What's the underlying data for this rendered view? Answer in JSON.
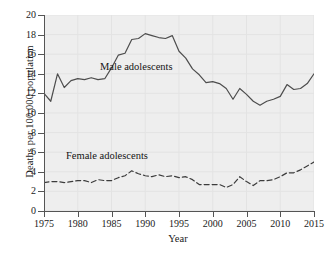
{
  "chart_data": {
    "type": "line",
    "title": "",
    "xlabel": "Year",
    "ylabel": "Deaths per 100,000 population",
    "xlim": [
      1975,
      2015
    ],
    "ylim": [
      0,
      20
    ],
    "xticks": [
      1975,
      1980,
      1985,
      1990,
      1995,
      2000,
      2005,
      2010,
      2015
    ],
    "yticks": [
      0,
      2,
      4,
      6,
      8,
      10,
      12,
      14,
      16,
      18,
      20
    ],
    "grid": true,
    "legend_position": "inline-annotations",
    "x": [
      1975,
      1976,
      1977,
      1978,
      1979,
      1980,
      1981,
      1982,
      1983,
      1984,
      1985,
      1986,
      1987,
      1988,
      1989,
      1990,
      1991,
      1992,
      1993,
      1994,
      1995,
      1996,
      1997,
      1998,
      1999,
      2000,
      2001,
      2002,
      2003,
      2004,
      2005,
      2006,
      2007,
      2008,
      2009,
      2010,
      2011,
      2012,
      2013,
      2014,
      2015
    ],
    "series": [
      {
        "name": "Male adolescents",
        "style": "solid",
        "color": "#4d4d4d",
        "annotation": "Male adolescents",
        "values": [
          12.0,
          11.2,
          14.0,
          12.6,
          13.3,
          13.5,
          13.4,
          13.6,
          13.4,
          13.5,
          14.6,
          15.9,
          16.1,
          17.5,
          17.6,
          18.1,
          17.9,
          17.7,
          17.6,
          17.9,
          16.3,
          15.6,
          14.5,
          13.9,
          13.1,
          13.2,
          13.0,
          12.5,
          11.4,
          12.5,
          11.9,
          11.2,
          10.8,
          11.2,
          11.4,
          11.7,
          12.9,
          12.4,
          12.5,
          13.0,
          14.0
        ]
      },
      {
        "name": "Female adolescents",
        "style": "dashed",
        "color": "#3c3c3c",
        "annotation": "Female adolescents",
        "values": [
          2.9,
          3.0,
          3.0,
          2.9,
          3.0,
          3.1,
          3.1,
          2.9,
          3.2,
          3.1,
          3.1,
          3.4,
          3.6,
          4.1,
          3.8,
          3.6,
          3.5,
          3.7,
          3.5,
          3.6,
          3.4,
          3.5,
          3.2,
          2.7,
          2.7,
          2.7,
          2.7,
          2.4,
          2.7,
          3.5,
          3.0,
          2.6,
          3.1,
          3.1,
          3.2,
          3.5,
          3.9,
          3.9,
          4.2,
          4.6,
          5.0
        ]
      }
    ]
  }
}
